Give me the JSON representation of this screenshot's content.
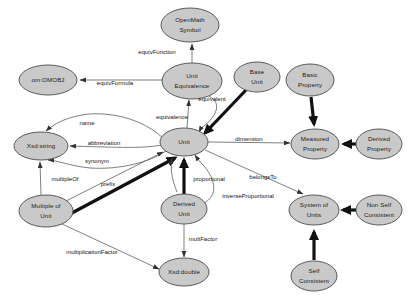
{
  "diagram": {
    "background_color": "#ffffff",
    "node_fill_color": "#c9c9c9",
    "node_stroke_color": "#4a4a4a",
    "edge_color": "#555555",
    "nodes": [
      {
        "id": "openmath_symbol",
        "label_line1": "OpenMath",
        "label_line2": "Symbol",
        "cx": 190,
        "cy": 25,
        "rx": 29,
        "ry": 17
      },
      {
        "id": "om_omobj",
        "label_line1": "om:OMOBJ",
        "label_line2": "",
        "cx": 48,
        "cy": 80,
        "rx": 29,
        "ry": 15
      },
      {
        "id": "unit_equivalence",
        "label_line1": "Unit",
        "label_line2": "Equivalence",
        "cx": 192,
        "cy": 81,
        "rx": 30,
        "ry": 18
      },
      {
        "id": "base_unit",
        "label_line1": "Base",
        "label_line2": "Unit",
        "cx": 257,
        "cy": 77,
        "rx": 23,
        "ry": 15
      },
      {
        "id": "basic_property",
        "label_line1": "Basic",
        "label_line2": "Property",
        "cx": 310,
        "cy": 80,
        "rx": 24,
        "ry": 16
      },
      {
        "id": "xsd_string",
        "label_line1": "Xsd:string",
        "label_line2": "",
        "cx": 41,
        "cy": 146,
        "rx": 27,
        "ry": 14
      },
      {
        "id": "unit",
        "label_line1": "Unit",
        "label_line2": "",
        "cx": 184,
        "cy": 142,
        "rx": 24,
        "ry": 14
      },
      {
        "id": "measured_property",
        "label_line1": "Measured",
        "label_line2": "Property",
        "cx": 315,
        "cy": 144,
        "rx": 24,
        "ry": 15
      },
      {
        "id": "derived_property",
        "label_line1": "Derived",
        "label_line2": "Property",
        "cx": 379,
        "cy": 144,
        "rx": 23,
        "ry": 15
      },
      {
        "id": "multiple_of_unit",
        "label_line1": "Multiple of",
        "label_line2": "Unit",
        "cx": 46,
        "cy": 211,
        "rx": 27,
        "ry": 16
      },
      {
        "id": "derived_unit",
        "label_line1": "Derived",
        "label_line2": "Unit",
        "cx": 184,
        "cy": 209,
        "rx": 23,
        "ry": 15
      },
      {
        "id": "system_of_units",
        "label_line1": "System of",
        "label_line2": "Units",
        "cx": 314,
        "cy": 210,
        "rx": 25,
        "ry": 15
      },
      {
        "id": "non_self_consistent",
        "label_line1": "Non Self",
        "label_line2": "Consistent",
        "cx": 379,
        "cy": 210,
        "rx": 23,
        "ry": 15
      },
      {
        "id": "xsd_double",
        "label_line1": "Xsd:double",
        "label_line2": "",
        "cx": 184,
        "cy": 272,
        "rx": 25,
        "ry": 14
      },
      {
        "id": "self_consistent",
        "label_line1": "Self",
        "label_line2": "Consistent",
        "cx": 314,
        "cy": 276,
        "rx": 23,
        "ry": 15
      }
    ],
    "edge_labels": [
      {
        "id": "equivFunction",
        "text": "equivFunction",
        "x": 157,
        "y": 52
      },
      {
        "id": "equivFormula",
        "text": "equivFormula",
        "x": 115,
        "y": 83
      },
      {
        "id": "equivalent",
        "text": "equivalent",
        "x": 212,
        "y": 99
      },
      {
        "id": "equivalence",
        "text": "equivalence",
        "x": 172,
        "y": 117
      },
      {
        "id": "name",
        "text": "name",
        "x": 87,
        "y": 123
      },
      {
        "id": "abbreviation",
        "text": "abbreviation",
        "x": 104,
        "y": 143
      },
      {
        "id": "dimension",
        "text": "dimension",
        "x": 249,
        "y": 139
      },
      {
        "id": "synonym",
        "text": "synonym",
        "x": 97,
        "y": 161
      },
      {
        "id": "multipleOf",
        "text": "multipleOf",
        "x": 65,
        "y": 179
      },
      {
        "id": "prefix",
        "text": "prefix",
        "x": 108,
        "y": 184
      },
      {
        "id": "proportional",
        "text": "proportional",
        "x": 209,
        "y": 179
      },
      {
        "id": "belongsTo",
        "text": "belongsTo",
        "x": 263,
        "y": 177
      },
      {
        "id": "inverseProportional",
        "text": "inverseProportional",
        "x": 248,
        "y": 196
      },
      {
        "id": "multFactor",
        "text": "multFactor",
        "x": 203,
        "y": 239
      },
      {
        "id": "multiplicationFactor",
        "text": "multiplicationFactor",
        "x": 92,
        "y": 252
      }
    ]
  }
}
